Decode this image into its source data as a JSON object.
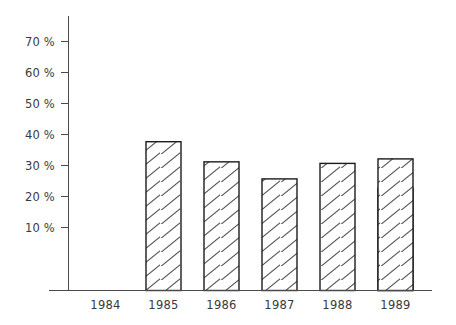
{
  "chart_data": {
    "type": "bar",
    "title": "",
    "subtitle": "",
    "xlabel": "",
    "ylabel": "",
    "categories": [
      "1984",
      "1985",
      "1986",
      "1987",
      "1988",
      "1989"
    ],
    "values": [
      62,
      48,
      41.5,
      36,
      41,
      33
    ],
    "ylim": [
      0,
      75
    ],
    "yticks": [
      10,
      20,
      30,
      40,
      50,
      60,
      70
    ],
    "ytick_labels": [
      "10 %",
      "20 %",
      "30 %",
      "40 %",
      "50 %",
      "60 %",
      "70 %"
    ],
    "grid": false,
    "legend": null,
    "legend_position": "none",
    "annotations": [],
    "series": [
      {
        "name": "",
        "values": [
          62,
          48,
          41.5,
          36,
          41,
          33
        ]
      }
    ],
    "style": {
      "bar_fill": "hatched-diagonal",
      "bar_edge_color": "#1c1c1c",
      "hatch_color": "#555555",
      "axis_color": "#4a4a4a",
      "text_color": "#3a3a3a",
      "background": "#ffffff"
    }
  }
}
